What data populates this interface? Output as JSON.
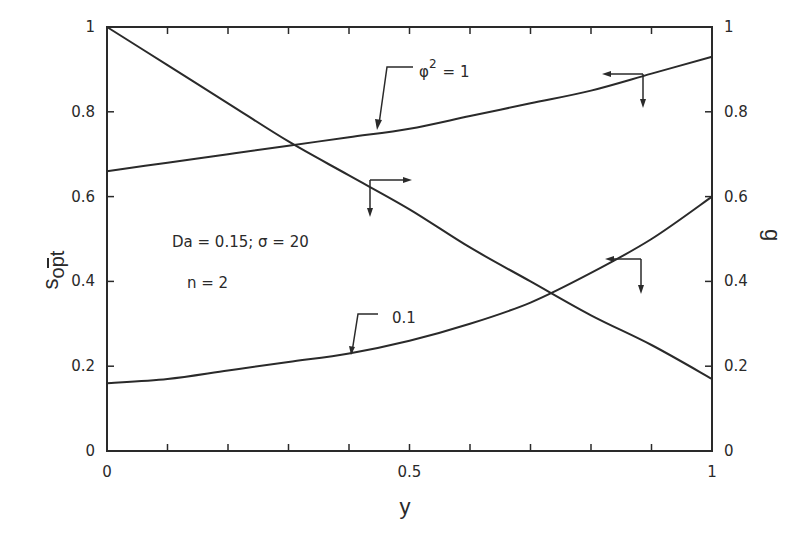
{
  "chart_data": {
    "type": "line",
    "title": "",
    "xlabel": "y",
    "ylabel_left": "s̄opt",
    "ylabel_right": "g",
    "xlim": [
      0,
      1
    ],
    "ylim_left": [
      0,
      1
    ],
    "ylim_right": [
      0,
      1
    ],
    "grid": false,
    "x_ticks": [
      "0",
      "0.5",
      "1"
    ],
    "y_ticks_left": [
      "0",
      "0.2",
      "0.4",
      "0.6",
      "0.8",
      "1"
    ],
    "y_ticks_right": [
      "0",
      "0.2",
      "0.4",
      "0.6",
      "0.8",
      "1"
    ],
    "x": [
      0,
      0.1,
      0.2,
      0.3,
      0.4,
      0.5,
      0.6,
      0.7,
      0.8,
      0.9,
      1.0
    ],
    "series": [
      {
        "name": "φ² = 1",
        "axis": "left",
        "values": [
          0.66,
          0.68,
          0.7,
          0.72,
          0.74,
          0.76,
          0.79,
          0.82,
          0.85,
          0.89,
          0.93
        ]
      },
      {
        "name": "0.1",
        "axis": "left",
        "values": [
          0.16,
          0.17,
          0.19,
          0.21,
          0.23,
          0.26,
          0.3,
          0.35,
          0.42,
          0.5,
          0.6
        ]
      },
      {
        "name": "g",
        "axis": "right",
        "values": [
          1.0,
          0.91,
          0.82,
          0.73,
          0.65,
          0.57,
          0.48,
          0.4,
          0.32,
          0.25,
          0.17
        ]
      }
    ],
    "annotations": [
      {
        "text": "φ² = 1",
        "points_to": "upper s̄opt curve"
      },
      {
        "text": "0.1",
        "points_to": "lower s̄opt curve"
      },
      {
        "text": "Da = 0.15; σ = 20"
      },
      {
        "text": "n = 2"
      }
    ]
  },
  "labels": {
    "x_axis": "y",
    "y_left": "s",
    "y_left_sub": "opt",
    "y_right": "g",
    "param_line1": "Da  = 0.15;  σ  = 20",
    "param_line2": "n = 2",
    "curve_label_phi": "φ",
    "curve_label_phi_sup": "2",
    "curve_label_phi_eq": "= 1",
    "curve_label_low": "0.1"
  },
  "ticks": {
    "x": [
      {
        "v": 0,
        "t": "0"
      },
      {
        "v": 0.5,
        "t": "0.5"
      },
      {
        "v": 1,
        "t": "1"
      }
    ],
    "left": [
      {
        "v": 0,
        "t": "0"
      },
      {
        "v": 0.2,
        "t": "0.2"
      },
      {
        "v": 0.4,
        "t": "0.4"
      },
      {
        "v": 0.6,
        "t": "0.6"
      },
      {
        "v": 0.8,
        "t": "0.8"
      },
      {
        "v": 1,
        "t": "1"
      }
    ],
    "right": [
      {
        "v": 0,
        "t": "0"
      },
      {
        "v": 0.2,
        "t": "0.2"
      },
      {
        "v": 0.4,
        "t": "0.4"
      },
      {
        "v": 0.6,
        "t": "0.6"
      },
      {
        "v": 0.8,
        "t": "0.8"
      },
      {
        "v": 1,
        "t": "1"
      }
    ]
  },
  "colors": {
    "ink": "#2a2a2a",
    "background": "#ffffff"
  }
}
